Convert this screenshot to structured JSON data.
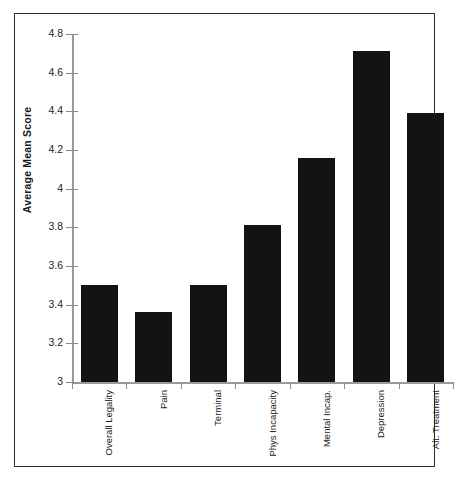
{
  "scan_artifact_text": "",
  "chart_data": {
    "type": "bar",
    "title": "",
    "xlabel": "",
    "ylabel": "Average Mean Score",
    "ylim": [
      3,
      4.8
    ],
    "ytick_step": 0.2,
    "grid": false,
    "legend": null,
    "bar_color": "#131313",
    "axis_color": "#9a9a9a",
    "frame_color": "#2b2b2b",
    "categories": [
      "Overall Legality",
      "Pain",
      "Terminal",
      "Phys Incapacity",
      "Mental Incap.",
      "Depression",
      "Alt. Treatment"
    ],
    "values": [
      3.5,
      3.36,
      3.5,
      3.81,
      4.16,
      4.71,
      4.39
    ],
    "ytick_labels": [
      "4.8",
      "4.6",
      "4.4",
      "4.2",
      "4",
      "3.8",
      "3.6",
      "3.4",
      "3.2",
      "3"
    ],
    "ytick_values": [
      4.8,
      4.6,
      4.4,
      4.2,
      4.0,
      3.8,
      3.6,
      3.4,
      3.2,
      3.0
    ]
  }
}
